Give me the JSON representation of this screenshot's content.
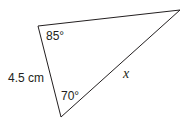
{
  "diagram": {
    "type": "triangle",
    "vertices": {
      "top_left": [
        38,
        26
      ],
      "right": [
        180,
        10
      ],
      "bottom": [
        61,
        117
      ]
    },
    "angles": {
      "top_left": "85°",
      "bottom": "70°"
    },
    "sides": {
      "left": "4.5 cm",
      "hypotenuse": "x"
    },
    "stroke_color": "#231f20"
  }
}
